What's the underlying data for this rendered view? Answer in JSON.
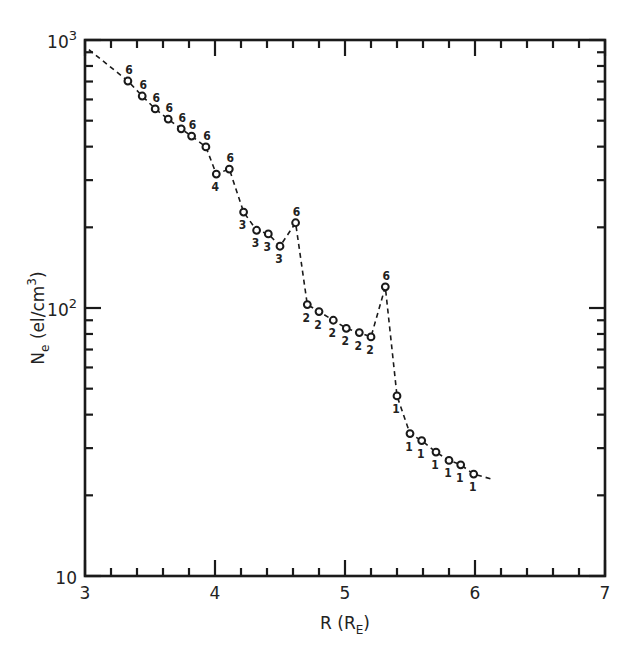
{
  "chart_data": {
    "type": "line",
    "title": "",
    "xlabel": "R (R_E)",
    "xlabel_main": "R (R",
    "xlabel_sub": "E",
    "xlabel_close": ")",
    "ylabel": "N_e (el/cm^3)",
    "ylabel_main": "N",
    "ylabel_sub": "e",
    "ylabel_units": " (el/cm",
    "ylabel_sup": "3",
    "ylabel_close": ")",
    "xlim": [
      3,
      7
    ],
    "ylim": [
      10,
      1000
    ],
    "yscale": "log",
    "grid": false,
    "legend": null,
    "x_ticks": [
      "3",
      "4",
      "5",
      "6",
      "7"
    ],
    "y_ticks": [
      {
        "value": 10,
        "base": "10",
        "exp": ""
      },
      {
        "value": 100,
        "base": "10",
        "exp": "2"
      },
      {
        "value": 1000,
        "base": "10",
        "exp": "3"
      }
    ],
    "series": [
      {
        "name": "Ne measurements",
        "style": "dashed line with open circle markers",
        "x": [
          3.33,
          3.44,
          3.54,
          3.64,
          3.74,
          3.82,
          3.93,
          4.01,
          4.11,
          4.22,
          4.32,
          4.41,
          4.5,
          4.62,
          4.71,
          4.8,
          4.91,
          5.01,
          5.11,
          5.2,
          5.31,
          5.4,
          5.5,
          5.59,
          5.7,
          5.8,
          5.89,
          5.99
        ],
        "values": [
          703,
          618,
          553,
          507,
          466,
          438,
          399,
          316,
          330,
          228,
          195,
          189,
          170,
          208,
          103,
          97,
          90,
          84,
          81,
          78,
          120,
          47,
          34,
          32,
          29,
          27,
          26,
          24
        ],
        "annotations": [
          "6",
          "6",
          "6",
          "6",
          "6",
          "6",
          "6",
          "4",
          "6",
          "3",
          "3",
          "3",
          "3",
          "6",
          "2",
          "2",
          "2",
          "2",
          "2",
          "2",
          "6",
          "1",
          "1",
          "1",
          "1",
          "1",
          "1",
          "1"
        ]
      }
    ],
    "line_start": {
      "x": 3.03,
      "y": 920
    },
    "line_end": {
      "x": 6.13,
      "y": 23
    }
  }
}
